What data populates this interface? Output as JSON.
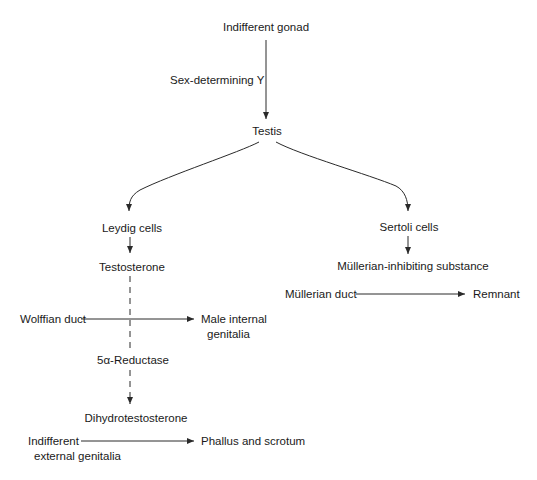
{
  "diagram": {
    "nodes": {
      "indifferent_gonad": "Indifferent gonad",
      "sex_determining": "Sex-determining Y",
      "testis": "Testis",
      "leydig_cells": "Leydig cells",
      "sertoli_cells": "Sertoli cells",
      "testosterone": "Testosterone",
      "mis": "Müllerian-inhibiting substance",
      "mullerian_duct": "Müllerian duct",
      "remnant": "Remnant",
      "wolffian_duct": "Wolffian duct",
      "male_internal_line1": "Male internal",
      "male_internal_line2": "genitalia",
      "reductase": "5α-Reductase",
      "dht": "Dihydrotestosterone",
      "indiff_ext_line1": "Indifferent",
      "indiff_ext_line2": "external genitalia",
      "phallus": "Phallus and scrotum"
    },
    "edges": [
      {
        "from": "Indifferent gonad",
        "to": "Testis",
        "label": "Sex-determining Y",
        "style": "solid"
      },
      {
        "from": "Testis",
        "to": "Leydig cells",
        "style": "solid-curved"
      },
      {
        "from": "Testis",
        "to": "Sertoli cells",
        "style": "solid-curved"
      },
      {
        "from": "Leydig cells",
        "to": "Testosterone",
        "style": "solid"
      },
      {
        "from": "Sertoli cells",
        "to": "Müllerian-inhibiting substance",
        "style": "solid"
      },
      {
        "from": "Müllerian duct",
        "to": "Remnant",
        "style": "solid"
      },
      {
        "from": "Testosterone",
        "to": "Dihydrotestosterone",
        "label": "5α-Reductase",
        "style": "dashed"
      },
      {
        "from": "Wolffian duct",
        "to": "Male internal genitalia",
        "style": "solid"
      },
      {
        "from": "Indifferent external genitalia",
        "to": "Phallus and scrotum",
        "style": "solid"
      }
    ],
    "colors": {
      "line": "#2a2a2a",
      "text": "#1a1a1a",
      "background": "#ffffff"
    }
  }
}
